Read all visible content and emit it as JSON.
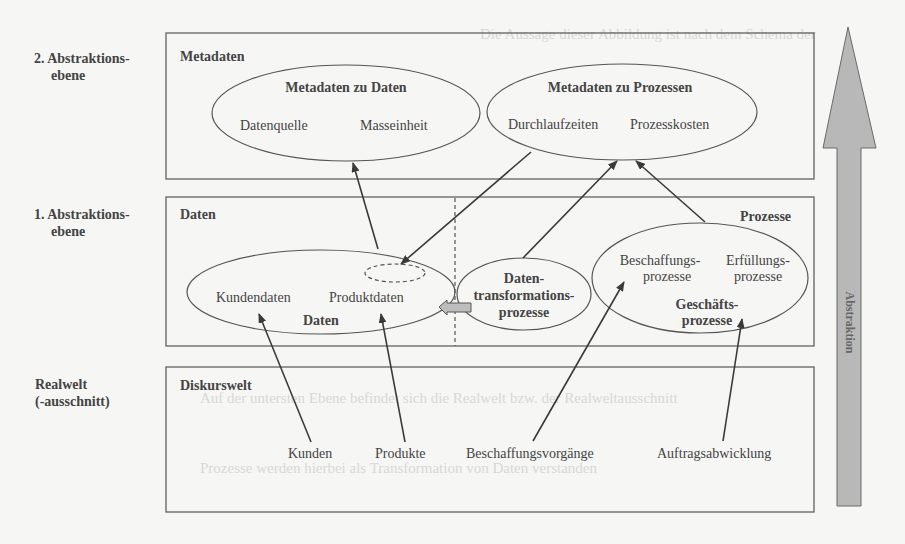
{
  "levels": {
    "level2": {
      "line1": "2. Abstraktions-",
      "line2": "ebene"
    },
    "level1": {
      "line1": "1. Abstraktions-",
      "line2": "ebene"
    },
    "real": {
      "line1": "Realwelt",
      "line2": "(-ausschnitt)"
    }
  },
  "boxes": {
    "metadaten": {
      "title": "Metadaten"
    },
    "daten": {
      "title": "Daten",
      "title_right": "Prozesse"
    },
    "diskurswelt": {
      "title": "Diskurswelt"
    }
  },
  "ellipses": {
    "meta_daten": {
      "title": "Metadaten zu Daten",
      "item1": "Datenquelle",
      "item2": "Masseinheit"
    },
    "meta_prozesse": {
      "title": "Metadaten zu Prozessen",
      "item1": "Durchlaufzeiten",
      "item2": "Prozesskosten"
    },
    "daten": {
      "item1": "Kundendaten",
      "item2": "Produktdaten",
      "title": "Daten"
    },
    "transformation": {
      "line1": "Daten-",
      "line2": "transformations-",
      "line3": "prozesse"
    },
    "geschaeft": {
      "item1a": "Beschaffungs-",
      "item1b": "prozesse",
      "item2a": "Erfüllungs-",
      "item2b": "prozesse",
      "title1": "Geschäfts-",
      "title2": "prozesse"
    }
  },
  "realworld_items": [
    "Kunden",
    "Produkte",
    "Beschaffungsvorgänge",
    "Auftragsabwicklung"
  ],
  "abstraction_arrow": {
    "label": "Abstraktion",
    "color": "#b8b8b8"
  },
  "background_text": [
    "Die Aussage dieser Abbildung ist nach dem Schema der",
    "Abb. 3: Realwelt, Daten und Metadaten",
    "Auf der untersten Ebene befindet sich die Realwelt bzw. der Realweltausschnitt",
    "Prozesse werden hierbei als Transformation von Daten verstanden"
  ]
}
